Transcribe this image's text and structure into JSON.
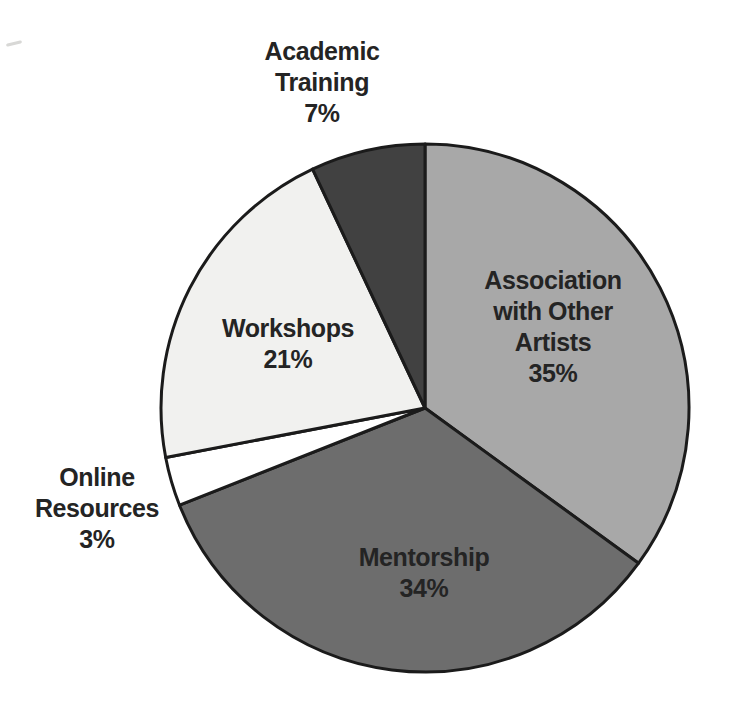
{
  "chart_data": {
    "type": "pie",
    "title": "",
    "unit": "%",
    "start_angle_deg": 0,
    "direction": "clockwise",
    "legend": "none",
    "labels_position": "inside-and-outside",
    "outline_color": "#1b1b1b",
    "background_color": "#ffffff",
    "text_color": "#242424",
    "categories": [
      "Association with Other Artists",
      "Mentorship",
      "Online Resources",
      "Workshops",
      "Academic Training"
    ],
    "values": [
      35,
      34,
      3,
      21,
      7
    ],
    "slices": [
      {
        "key": "association-with-other-artists",
        "label": "Association with Other Artists",
        "value": 35,
        "pct": "35%",
        "color": "#a8a8a8"
      },
      {
        "key": "mentorship",
        "label": "Mentorship",
        "value": 34,
        "pct": "34%",
        "color": "#6d6d6d"
      },
      {
        "key": "online-resources",
        "label": "Online Resources",
        "value": 3,
        "pct": "3%",
        "color": "#ffffff"
      },
      {
        "key": "workshops",
        "label": "Workshops",
        "value": 21,
        "pct": "21%",
        "color": "#f1f1ef"
      },
      {
        "key": "academic-training",
        "label": "Academic Training",
        "value": 7,
        "pct": "7%",
        "color": "#414141"
      }
    ]
  }
}
